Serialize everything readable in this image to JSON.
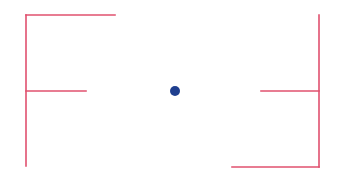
{
  "diagram": {
    "background": "#ffffff",
    "line_color": "#e0506e",
    "dot_color": "#1f3f8f",
    "line_width": 1.6,
    "left_bracket": {
      "vertical": {
        "x": 26,
        "y1": 15,
        "y2": 166
      },
      "top_arm": {
        "x1": 26,
        "x2": 115,
        "y": 15
      },
      "middle_arm": {
        "x1": 26,
        "x2": 86,
        "y": 91
      }
    },
    "right_bracket": {
      "vertical": {
        "x": 319,
        "y1": 15,
        "y2": 167
      },
      "middle_arm": {
        "x1": 261,
        "x2": 319,
        "y": 91
      },
      "bottom_arm": {
        "x1": 232,
        "x2": 319,
        "y": 167
      }
    },
    "center_dot": {
      "cx": 175,
      "cy": 91,
      "r": 5
    }
  }
}
